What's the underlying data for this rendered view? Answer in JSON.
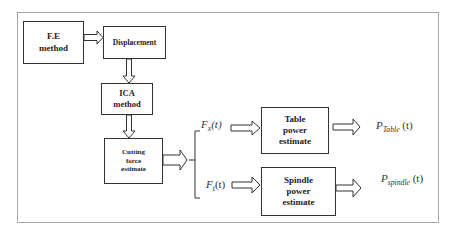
{
  "diagram": {
    "nodes": {
      "fe_method": {
        "line1": "F.E",
        "line2": "method"
      },
      "displacement": {
        "line1": "Displacement"
      },
      "ica_method": {
        "line1": "ICA",
        "line2": "method"
      },
      "cutting_force": {
        "line1": "Cutting",
        "line2": "force",
        "line3": "estimate"
      },
      "table_power": {
        "line1": "Table",
        "line2": "power",
        "line3": "estimate"
      },
      "spindle_power": {
        "line1": "Spindle",
        "line2": "power",
        "line3": "estimate"
      }
    },
    "signals": {
      "fx": {
        "base": "F",
        "sub": "x",
        "arg": "(t)"
      },
      "ft": {
        "base": "F",
        "sub": "t",
        "arg": "(t)"
      },
      "p_table": {
        "base": "P",
        "sub": "Table",
        "arg": "(t)"
      },
      "p_spindle": {
        "base": "P",
        "sub": "spindle",
        "arg": "(t)"
      }
    },
    "edges": [
      {
        "from": "F.E method",
        "to": "Displacement"
      },
      {
        "from": "Displacement",
        "to": "ICA method"
      },
      {
        "from": "ICA method",
        "to": "Cutting force estimate"
      },
      {
        "from": "Cutting force estimate",
        "to": "Fx(t) / Ft(t) split"
      },
      {
        "from": "Fx(t)",
        "to": "Table power estimate"
      },
      {
        "from": "Ft(t)",
        "to": "Spindle power estimate"
      },
      {
        "from": "Table power estimate",
        "to": "P_Table(t)"
      },
      {
        "from": "Spindle power estimate",
        "to": "P_spindle(t)"
      }
    ]
  }
}
